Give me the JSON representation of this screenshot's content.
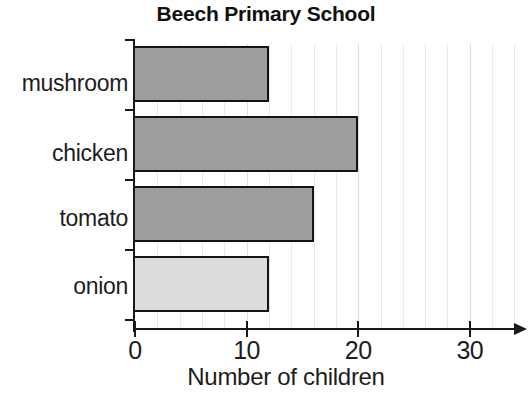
{
  "chart_data": {
    "type": "bar",
    "orientation": "horizontal",
    "title": "Beech Primary School",
    "xlabel": "Number of children",
    "ylabel": "",
    "categories": [
      "mushroom",
      "chicken",
      "tomato",
      "onion"
    ],
    "values": [
      12,
      20,
      16,
      12
    ],
    "xlim": [
      0,
      34.5
    ],
    "xticks": [
      0,
      10,
      20,
      30
    ],
    "xtick_labels": [
      "0",
      "10",
      "20",
      "30"
    ],
    "grid": true,
    "grid_axis": "x",
    "grid_interval": 2,
    "legend": null,
    "bar_colors": [
      "#9d9d9d",
      "#9d9d9d",
      "#9d9d9d",
      "#dcdcdc"
    ],
    "bar_edge_color": "#141414",
    "grid_color": "#e9e9e9",
    "axis_color": "#1a1a1a",
    "text_color": "#1d1d1d",
    "x_axis_has_arrow": true
  }
}
